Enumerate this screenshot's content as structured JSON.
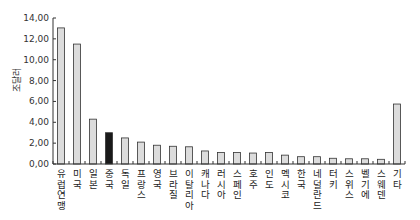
{
  "chart_data": {
    "type": "bar",
    "title": "",
    "xlabel": "",
    "ylabel": "조달러",
    "ylim": [
      0,
      14
    ],
    "yticks": [
      "0,00",
      "2,00",
      "4,00",
      "6,00",
      "8,00",
      "10,00",
      "12,00",
      "14,00"
    ],
    "grid": false,
    "legend": null,
    "categories": [
      "유럽연맹",
      "미국",
      "일본",
      "중국",
      "독일",
      "프랑스",
      "영국",
      "브라질",
      "이탈리아",
      "캐나다",
      "러시아",
      "스페인",
      "호주",
      "인도",
      "멕시코",
      "한국",
      "네덜란드",
      "터키",
      "스위스",
      "벨기에",
      "스웨덴",
      "기타"
    ],
    "values": [
      13.05,
      11.5,
      4.3,
      3.0,
      2.5,
      2.1,
      1.8,
      1.7,
      1.65,
      1.25,
      1.1,
      1.1,
      1.05,
      1.1,
      0.85,
      0.7,
      0.7,
      0.55,
      0.5,
      0.5,
      0.45,
      5.75
    ],
    "highlight_index": 3,
    "colors": {
      "bar": "#dcdcdc",
      "bar_stroke": "#333333",
      "highlight": "#1a1a1a",
      "axis": "#333333"
    }
  }
}
